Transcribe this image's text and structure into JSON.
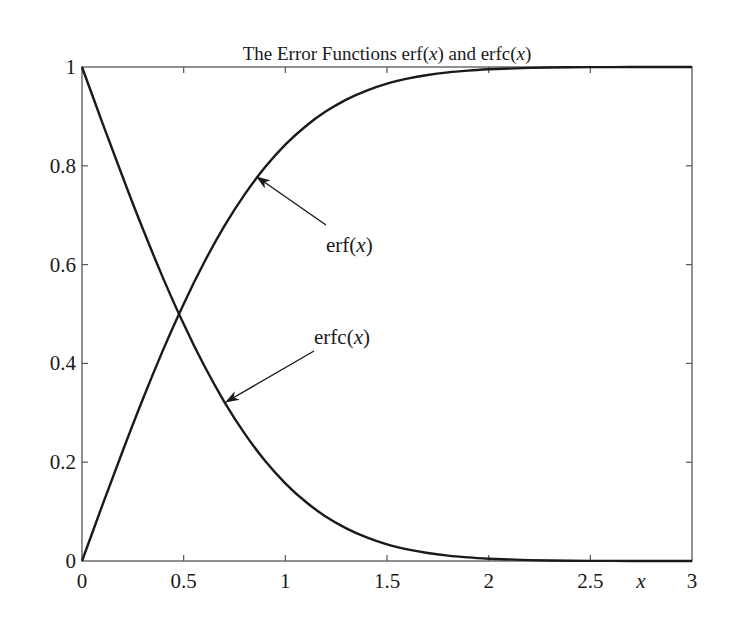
{
  "chart_data": {
    "type": "line",
    "title": "The Error Functions erf(x) and erfc(x)",
    "title_parts": {
      "pre": "The Error Functions erf(",
      "x1": "x",
      "mid": ") and erfc(",
      "x2": "x",
      "post": ")"
    },
    "xlabel": "x",
    "ylabel": "",
    "xlim": [
      0,
      3
    ],
    "ylim": [
      0,
      1
    ],
    "grid": false,
    "legend": "none",
    "x_ticks": [
      "0",
      "0.5",
      "1",
      "1.5",
      "2",
      "2.5",
      "3"
    ],
    "y_ticks": [
      "0",
      "0.2",
      "0.4",
      "0.6",
      "0.8",
      "1"
    ],
    "x": [
      0,
      0.1,
      0.2,
      0.3,
      0.4,
      0.5,
      0.6,
      0.7,
      0.8,
      0.9,
      1.0,
      1.1,
      1.2,
      1.3,
      1.4,
      1.5,
      1.6,
      1.7,
      1.8,
      1.9,
      2.0,
      2.2,
      2.4,
      2.6,
      2.8,
      3.0
    ],
    "series": [
      {
        "name": "erf(x)",
        "values": [
          0,
          0.1125,
          0.2227,
          0.3286,
          0.4284,
          0.5205,
          0.6039,
          0.6778,
          0.7421,
          0.7969,
          0.8427,
          0.8802,
          0.9103,
          0.934,
          0.9523,
          0.9661,
          0.9763,
          0.9838,
          0.9891,
          0.9928,
          0.9953,
          0.9981,
          0.9993,
          0.9998,
          0.9999,
          1.0
        ]
      },
      {
        "name": "erfc(x)",
        "values": [
          1,
          0.8875,
          0.7773,
          0.6714,
          0.5716,
          0.4795,
          0.3961,
          0.3222,
          0.2579,
          0.2031,
          0.1573,
          0.1198,
          0.0897,
          0.066,
          0.0477,
          0.0339,
          0.0237,
          0.0162,
          0.0109,
          0.0072,
          0.0047,
          0.0019,
          0.0007,
          0.0002,
          0.0001,
          0.0
        ]
      }
    ],
    "annotations": [
      {
        "label_pre": "erf(",
        "label_var": "x",
        "label_post": ")",
        "text": "erf(x)",
        "text_x": 326,
        "text_y": 252,
        "arrow_from": [
          326,
          225
        ],
        "arrow_to": [
          257,
          177
        ]
      },
      {
        "label_pre": "erfc(",
        "label_var": "x",
        "label_post": ")",
        "text": "erfc(x)",
        "text_x": 314,
        "text_y": 344,
        "arrow_from": [
          314,
          351
        ],
        "arrow_to": [
          226,
          402
        ]
      }
    ]
  }
}
